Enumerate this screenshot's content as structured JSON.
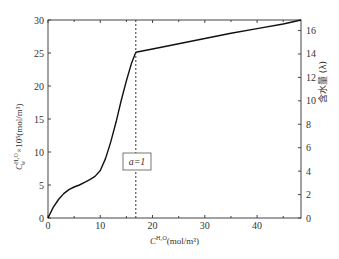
{
  "chart_data": {
    "type": "line",
    "title": "",
    "xlabel": "C^{H2O}(mol/m³)",
    "ylabel": "C_w^{H2O}×10⁵(mol/m³)",
    "y2label": "含水量 (λ)",
    "xlim": [
      0,
      48.4
    ],
    "ylim": [
      0,
      30
    ],
    "y2lim": [
      0,
      16.9
    ],
    "x_ticks": [
      0,
      10,
      20,
      30,
      40
    ],
    "y_ticks": [
      0,
      5,
      10,
      15,
      20,
      25,
      30
    ],
    "y2_ticks": [
      0,
      2,
      4,
      6,
      8,
      10,
      12,
      14,
      16
    ],
    "grid": false,
    "series": [
      {
        "name": "absorption curve",
        "x": [
          0,
          1,
          2,
          3,
          4,
          5,
          6,
          7,
          8,
          9,
          10,
          11,
          12,
          13,
          14,
          15,
          16,
          16.8,
          20,
          25,
          30,
          35,
          40,
          45,
          48.4
        ],
        "y": [
          0,
          1.6,
          2.8,
          3.7,
          4.3,
          4.7,
          5.0,
          5.4,
          5.8,
          6.3,
          7.2,
          9.0,
          11.5,
          14.5,
          17.8,
          20.8,
          23.5,
          25.1,
          25.6,
          26.4,
          27.2,
          28.0,
          28.7,
          29.4,
          30.0
        ]
      }
    ],
    "annotations": [
      {
        "type": "vline",
        "x": 16.8,
        "style": "dashed"
      },
      {
        "type": "textbox",
        "text": "a=1",
        "x": 17,
        "y": 7.5
      }
    ]
  },
  "labels": {
    "annotation": "a=1",
    "x_axis": "C",
    "x_axis_sup": "H₂O",
    "x_axis_unit": "(mol/m³)",
    "y_axis": "C",
    "y_axis_sup": "H₂O",
    "y_axis_sub": "w",
    "y_axis_unit": "×10⁵(mol/m³)",
    "y2_axis": "含水量 (λ)"
  }
}
